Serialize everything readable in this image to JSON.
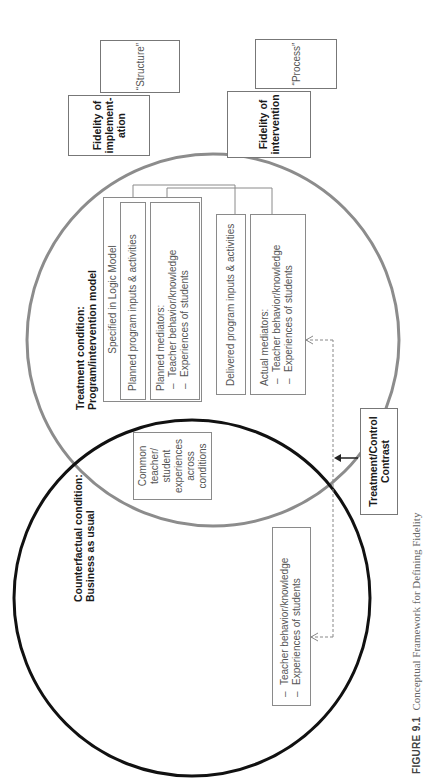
{
  "figure": {
    "label": "FIGURE 9.1",
    "caption": "Conceptual Framework for Defining Fidelity",
    "orientation": "rotated 90° counter-clockwise"
  },
  "fidelity_boxes": {
    "implementation": {
      "label": "Fidelity of implementation",
      "line1": "Fidelity of",
      "line2": "implement-",
      "line3": "ation",
      "tag": "“Structure”"
    },
    "intervention": {
      "label": "Fidelity of intervention",
      "line1": "Fidelity of",
      "line2": "intervention",
      "tag": "“Process”"
    }
  },
  "treatment": {
    "title_line1": "Treatment condition:",
    "title_line2": "Program/intervention model",
    "circle_color": "#8c8c8c",
    "logic_model": {
      "header": "Specified in Logic Model",
      "planned_inputs": "Planned program inputs & activities",
      "planned_mediators": {
        "title": "Planned mediators:",
        "items": [
          "Teacher behavior/knowledge",
          "Experiences of students"
        ]
      }
    },
    "delivered_inputs": "Delivered program inputs & activities",
    "actual_mediators": {
      "title": "Actual mediators:",
      "items": [
        "Teacher behavior/knowledge",
        "Experiences of students"
      ]
    }
  },
  "common": {
    "lines": [
      "Common",
      "teacher/",
      "student",
      "experiences",
      "across",
      "conditions"
    ]
  },
  "counterfactual": {
    "title_line1": "Counterfactual condition:",
    "title_line2": "Business as usual",
    "circle_color": "#111111",
    "items": [
      "Teacher behavior/knowledge",
      "Experiences of students"
    ]
  },
  "contrast": {
    "line1": "Treatment/Control",
    "line2": "Contrast"
  }
}
